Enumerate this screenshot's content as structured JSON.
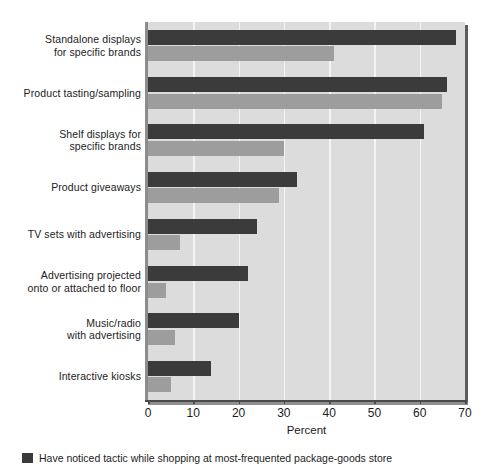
{
  "chart_data": {
    "type": "bar",
    "orientation": "horizontal",
    "title": "",
    "xlabel": "Percent",
    "ylabel": "",
    "xlim": [
      0,
      70
    ],
    "xticks": [
      0,
      10,
      20,
      30,
      40,
      50,
      60,
      70
    ],
    "grid": true,
    "legend_position": "bottom",
    "categories": [
      "Standalone displays\nfor specific brands",
      "Product tasting/sampling",
      "Shelf displays for\nspecific brands",
      "Product giveaways",
      "TV sets with advertising",
      "Advertising projected\nonto or attached to floor",
      "Music/radio\nwith advertising",
      "Interactive kiosks"
    ],
    "series": [
      {
        "name": "Have noticed tactic while shopping at most-frequented package-goods store",
        "color": "#3b3b3b",
        "values": [
          68,
          66,
          61,
          33,
          24,
          22,
          20,
          14
        ]
      },
      {
        "name": "Have purchased because of tactic",
        "color": "#9d9d9d",
        "values": [
          41,
          65,
          30,
          29,
          7,
          4,
          6,
          5
        ]
      }
    ]
  },
  "axis": {
    "x_title": "Percent",
    "tick_labels": [
      "0",
      "10",
      "20",
      "30",
      "40",
      "50",
      "60",
      "70"
    ]
  },
  "categories": [
    {
      "line1": "Standalone displays",
      "line2": "for specific brands"
    },
    {
      "line1": "Product tasting/sampling",
      "line2": ""
    },
    {
      "line1": "Shelf displays for",
      "line2": "specific brands"
    },
    {
      "line1": "Product giveaways",
      "line2": ""
    },
    {
      "line1": "TV sets with advertising",
      "line2": ""
    },
    {
      "line1": "Advertising projected",
      "line2": "onto or attached to floor"
    },
    {
      "line1": "Music/radio",
      "line2": "with advertising"
    },
    {
      "line1": "Interactive kiosks",
      "line2": ""
    }
  ],
  "legend": {
    "entries": [
      {
        "label": "Have noticed tactic while shopping at most-frequented package-goods store",
        "swatch": "dark"
      }
    ]
  },
  "colors": {
    "series_dark": "#3b3b3b",
    "series_light": "#9d9d9d",
    "plot_background": "#dcdcdc",
    "gridline": "#f4f4f4",
    "axis": "#4a4a4a"
  }
}
